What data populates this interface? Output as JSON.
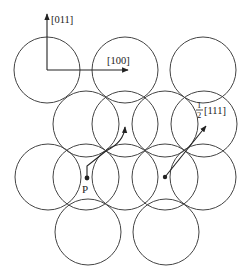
{
  "diagram": {
    "type": "crystal-plane-packing",
    "colors": {
      "line": "#444444",
      "text": "#222222",
      "background": "#ffffff"
    },
    "circle_radius": 33,
    "circles": [
      {
        "row": 1,
        "cx": 47,
        "cy": 70
      },
      {
        "row": 1,
        "cx": 125,
        "cy": 70
      },
      {
        "row": 1,
        "cx": 203,
        "cy": 70
      },
      {
        "row": 2,
        "cx": 86,
        "cy": 124
      },
      {
        "row": 2,
        "cx": 125,
        "cy": 124
      },
      {
        "row": 2,
        "cx": 165,
        "cy": 124
      },
      {
        "row": 2,
        "cx": 204,
        "cy": 124
      },
      {
        "row": 3,
        "cx": 48,
        "cy": 177
      },
      {
        "row": 3,
        "cx": 86,
        "cy": 177
      },
      {
        "row": 3,
        "cx": 125,
        "cy": 177
      },
      {
        "row": 3,
        "cx": 165,
        "cy": 177
      },
      {
        "row": 3,
        "cx": 203,
        "cy": 177
      },
      {
        "row": 4,
        "cx": 88,
        "cy": 232
      },
      {
        "row": 4,
        "cx": 166,
        "cy": 232
      }
    ],
    "axes": {
      "vertical": {
        "label": "[011]"
      },
      "horizontal": {
        "label": "[100]"
      }
    },
    "burgers_vector": {
      "fraction_numerator": "1",
      "fraction_denominator": "2",
      "direction": "[111]"
    },
    "point_label": "P"
  }
}
